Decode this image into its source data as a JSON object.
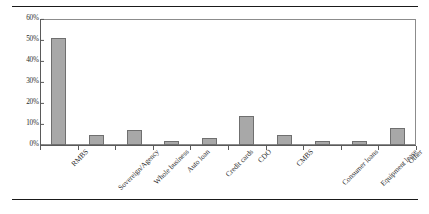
{
  "figure": {
    "background_color": "#ffffff",
    "rule_color": "#1a1a1a",
    "frame_color": "#8c8c8c",
    "axis_color": "#5a5a5a"
  },
  "chart_data": {
    "type": "bar",
    "title": "",
    "subtitle": "",
    "xlabel": "",
    "ylabel": "",
    "orientation": "vertical",
    "grid": false,
    "legend": false,
    "legend_position": "none",
    "bar_fill_color": "#a8a8a8",
    "bar_border_color": "#6f6f6f",
    "ylim": [
      0,
      60
    ],
    "ytick_step": 10,
    "ytick_labels": [
      "0%",
      "10%",
      "20%",
      "30%",
      "40%",
      "50%",
      "60%"
    ],
    "ytick_values": [
      0,
      10,
      20,
      30,
      40,
      50,
      60
    ],
    "value_suffix": "%",
    "categories": [
      "RMBS",
      "Sovereign/Agency",
      "Whole business",
      "Auto loan",
      "Credit cards",
      "CDO",
      "CMBS",
      "Consumer loans",
      "Equipment lease",
      "Other"
    ],
    "values": [
      51,
      5,
      7,
      2,
      3.5,
      14,
      5,
      2,
      2,
      8
    ]
  }
}
